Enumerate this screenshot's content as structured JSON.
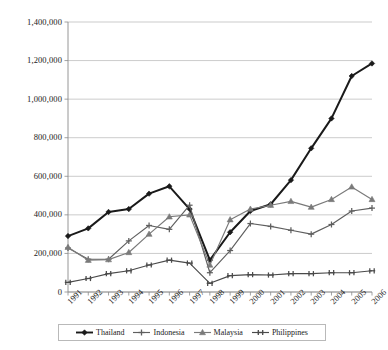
{
  "chart_data": {
    "type": "line",
    "title": "",
    "xlabel": "",
    "ylabel": "",
    "grid": true,
    "legend_position": "bottom",
    "ylim": [
      0,
      1400000
    ],
    "ytick_step": 200000,
    "ytick_labels": [
      "1,400,000",
      "1,200,000",
      "1,000,000",
      "800,000",
      "600,000",
      "400,000",
      "200,000",
      "0"
    ],
    "ytick_values": [
      1400000,
      1200000,
      1000000,
      800000,
      600000,
      400000,
      200000,
      0
    ],
    "categories": [
      "1991",
      "1992",
      "1993",
      "1994",
      "1995",
      "1996",
      "1997",
      "1998",
      "1999",
      "2000",
      "2001",
      "2002",
      "2003",
      "2004",
      "2005",
      "2006"
    ],
    "series": [
      {
        "name": "Thailand",
        "marker": "diamond",
        "color": "#1a1a1a",
        "values": [
          290000,
          330000,
          415000,
          430000,
          510000,
          548000,
          430000,
          165000,
          310000,
          420000,
          455000,
          580000,
          745000,
          900000,
          1120000,
          1185000
        ]
      },
      {
        "name": "Indonesia",
        "marker": "plus",
        "color": "#5f5f5f",
        "values": [
          228000,
          170000,
          170000,
          265000,
          345000,
          325000,
          450000,
          100000,
          215000,
          355000,
          340000,
          320000,
          300000,
          350000,
          420000,
          435000
        ]
      },
      {
        "name": "Malaysia",
        "marker": "triangle",
        "color": "#7a7a7a",
        "values": [
          232000,
          165000,
          168000,
          205000,
          300000,
          390000,
          400000,
          140000,
          375000,
          430000,
          450000,
          470000,
          440000,
          480000,
          545000,
          480000
        ]
      },
      {
        "name": "Philippines",
        "marker": "cross",
        "color": "#4a4a4a",
        "values": [
          50000,
          70000,
          95000,
          110000,
          140000,
          165000,
          150000,
          45000,
          85000,
          90000,
          88000,
          95000,
          95000,
          100000,
          100000,
          110000
        ]
      }
    ]
  },
  "legend": {
    "items": [
      {
        "label": "Thailand"
      },
      {
        "label": "Indonesia"
      },
      {
        "label": "Malaysia"
      },
      {
        "label": "Philippines"
      }
    ]
  }
}
